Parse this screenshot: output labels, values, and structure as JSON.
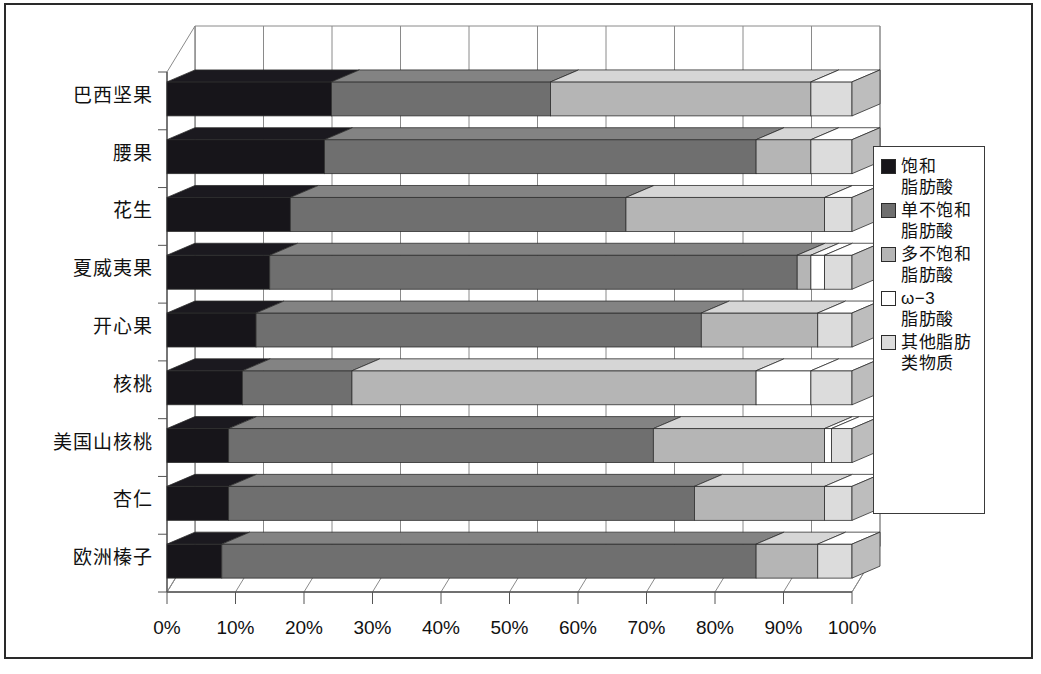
{
  "chart_data": {
    "type": "bar",
    "subtype": "stacked-horizontal-100-percent-3d",
    "title": "",
    "xlabel": "",
    "ylabel": "",
    "xlim": [
      0,
      100
    ],
    "xticks": [
      "0%",
      "10%",
      "20%",
      "30%",
      "40%",
      "50%",
      "60%",
      "70%",
      "80%",
      "90%",
      "100%"
    ],
    "xtick_values": [
      0,
      10,
      20,
      30,
      40,
      50,
      60,
      70,
      80,
      90,
      100
    ],
    "grid": true,
    "legend_position": "right",
    "categories": [
      "巴西坚果",
      "腰果",
      "花生",
      "夏威夷果",
      "开心果",
      "核桃",
      "美国山核桃",
      "杏仁",
      "欧洲榛子"
    ],
    "series": [
      {
        "name": "饱和脂肪酸",
        "color": "#17151a",
        "values": [
          24,
          23,
          18,
          15,
          13,
          11,
          9,
          9,
          8
        ]
      },
      {
        "name": "单不饱和脂肪酸",
        "color": "#6f6f6f",
        "values": [
          32,
          63,
          49,
          77,
          65,
          16,
          62,
          68,
          78
        ]
      },
      {
        "name": "多不饱和脂肪酸",
        "color": "#b5b5b5",
        "values": [
          38,
          8,
          29,
          2,
          17,
          59,
          25,
          19,
          9
        ]
      },
      {
        "name": "ω-3 脂肪酸",
        "color": "#ffffff",
        "values": [
          0,
          0,
          0,
          2,
          0,
          8,
          1,
          0,
          0
        ]
      },
      {
        "name": "其他脂肪类物质",
        "color": "#dcdcdc",
        "values": [
          6,
          6,
          4,
          4,
          5,
          6,
          3,
          4,
          5
        ]
      }
    ],
    "legend": [
      {
        "label_line1": "饱和",
        "label_line2": "脂肪酸",
        "color": "#17151a"
      },
      {
        "label_line1": "单不饱和",
        "label_line2": "脂肪酸",
        "color": "#6f6f6f"
      },
      {
        "label_line1": "多不饱和",
        "label_line2": "脂肪酸",
        "color": "#b5b5b5"
      },
      {
        "label_line1": "ω−3",
        "label_line2": "脂肪酸",
        "color": "#ffffff"
      },
      {
        "label_line1": "其他脂肪",
        "label_line2": "类物质",
        "color": "#dcdcdc"
      }
    ]
  }
}
